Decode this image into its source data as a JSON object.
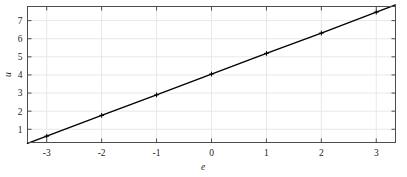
{
  "chart_data": {
    "type": "line",
    "title": "",
    "subtitle": "",
    "xlabel": "e",
    "ylabel": "u",
    "x": [
      -3,
      -2,
      -1,
      0,
      1,
      2,
      3
    ],
    "values": [
      0.62,
      1.77,
      2.9,
      4.05,
      5.19,
      6.31,
      7.47
    ],
    "series": [
      {
        "name": "u(e)",
        "x": [
          -3,
          -2,
          -1,
          0,
          1,
          2,
          3
        ],
        "values": [
          0.62,
          1.77,
          2.9,
          4.05,
          5.19,
          6.31,
          7.47
        ],
        "marker": "plus",
        "line_color": "#000000",
        "line_width": 1.4
      }
    ],
    "xlim": [
      -3.35,
      3.35
    ],
    "ylim": [
      0.27,
      7.78
    ],
    "xticks": [
      -3,
      -2,
      -1,
      0,
      1,
      2,
      3
    ],
    "xticklabels": [
      "-3",
      "-2",
      "-1",
      "0",
      "1",
      "2",
      "3"
    ],
    "yticks": [
      1,
      2,
      3,
      4,
      5,
      6,
      7
    ],
    "yticklabels": [
      "1",
      "2",
      "3",
      "4",
      "5",
      "6",
      "7"
    ],
    "grid": true,
    "grid_color": "#e8e8e8",
    "legend": null,
    "legend_position": "none",
    "annotations": [],
    "background_color": "#ffffff",
    "axes_color": "#4d4d4d"
  },
  "axis": {
    "x_title": "e",
    "y_title": "u"
  },
  "xticks": [
    {
      "label": "-3"
    },
    {
      "label": "-2"
    },
    {
      "label": "-1"
    },
    {
      "label": "0"
    },
    {
      "label": "1"
    },
    {
      "label": "2"
    },
    {
      "label": "3"
    }
  ],
  "yticks": [
    {
      "label": "7"
    },
    {
      "label": "6"
    },
    {
      "label": "5"
    },
    {
      "label": "4"
    },
    {
      "label": "3"
    },
    {
      "label": "2"
    },
    {
      "label": "1"
    }
  ]
}
